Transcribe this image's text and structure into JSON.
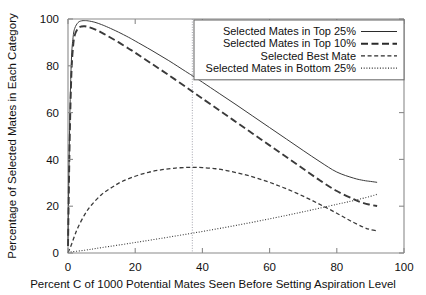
{
  "chart_data": {
    "type": "line",
    "title": "",
    "xlabel": "Percent C of 1000 Potential Mates Seen Before Setting Aspiration Level",
    "ylabel": "Percentage of Selected Mates in Each Category",
    "xlim": [
      0,
      100
    ],
    "ylim": [
      0,
      100
    ],
    "xticks": [
      0,
      20,
      40,
      60,
      80,
      100
    ],
    "yticks": [
      0,
      20,
      40,
      60,
      80,
      100
    ],
    "xtick_labels": [
      "0",
      "20",
      "40",
      "60",
      "80",
      "100"
    ],
    "ytick_labels": [
      "0",
      "20",
      "40",
      "60",
      "80",
      "100"
    ],
    "grid": false,
    "legend_position": "top-right",
    "annotations": [
      {
        "name": "optimal-stopping-reference-line",
        "type": "vline",
        "x": 37,
        "style": "dotted"
      }
    ],
    "series": [
      {
        "name": "Selected Mates in Top 25%",
        "style": "solid",
        "x": [
          0,
          0.5,
          1,
          1.5,
          2,
          3,
          4,
          5,
          6,
          8,
          10,
          12,
          15,
          18,
          20,
          25,
          30,
          35,
          37,
          40,
          45,
          50,
          55,
          60,
          65,
          70,
          75,
          80,
          85,
          88,
          90,
          92
        ],
        "values": [
          6,
          55,
          82,
          92,
          96,
          98.5,
          99.2,
          99.3,
          99.2,
          98.6,
          97.6,
          96.4,
          94.4,
          92.2,
          90.6,
          86.5,
          82.2,
          77.6,
          75.8,
          73,
          68.2,
          63.4,
          58.5,
          53.6,
          48.7,
          43.8,
          39,
          34.6,
          32,
          31,
          30.6,
          30.2
        ]
      },
      {
        "name": "Selected Mates in Top 10%",
        "style": "long-dash",
        "x": [
          0,
          0.5,
          1,
          1.5,
          2,
          3,
          4,
          5,
          6,
          8,
          10,
          12,
          15,
          18,
          20,
          25,
          30,
          35,
          37,
          40,
          45,
          50,
          55,
          60,
          65,
          70,
          75,
          80,
          85,
          88,
          90,
          92
        ],
        "values": [
          3,
          48,
          76,
          88,
          93,
          96,
          96.8,
          96.9,
          96.6,
          95.6,
          94.2,
          92.6,
          90.1,
          87.4,
          85.6,
          80.8,
          76,
          71,
          69,
          66,
          61,
          56,
          51,
          46,
          41,
          36,
          31,
          26.5,
          23,
          21.3,
          20.6,
          20.1
        ]
      },
      {
        "name": "Selected Best Mate",
        "style": "dash",
        "x": [
          0,
          1,
          2,
          3,
          5,
          7,
          10,
          13,
          16,
          20,
          24,
          28,
          32,
          36,
          37,
          40,
          44,
          48,
          52,
          56,
          60,
          64,
          68,
          72,
          76,
          80,
          84,
          88,
          90,
          92
        ],
        "values": [
          0.1,
          3.5,
          7.5,
          11,
          16.5,
          20.5,
          25,
          28,
          30.5,
          32.8,
          34.5,
          35.6,
          36.3,
          36.6,
          36.6,
          36.5,
          36,
          35,
          33.7,
          32.1,
          30.2,
          28,
          25.6,
          22.9,
          20,
          17,
          13.8,
          11,
          10,
          9.5
        ]
      },
      {
        "name": "Selected Mates in Bottom 25%",
        "style": "dotted",
        "x": [
          0,
          5,
          10,
          20,
          30,
          40,
          50,
          60,
          70,
          80,
          85,
          90,
          92
        ],
        "values": [
          0.3,
          1.2,
          2.3,
          4.5,
          6.8,
          9.2,
          11.8,
          14.6,
          17.6,
          20.8,
          22.4,
          24.2,
          25.1
        ]
      }
    ]
  },
  "legend": {
    "entries": [
      {
        "label": "Selected Mates in Top 25%",
        "style": "solid"
      },
      {
        "label": "Selected Mates in Top 10%",
        "style": "long-dash"
      },
      {
        "label": "Selected Best Mate",
        "style": "dash"
      },
      {
        "label": "Selected Mates in Bottom 25%",
        "style": "dotted"
      }
    ]
  },
  "colors": {
    "axis": "#8a8a8a",
    "text": "#111111",
    "line": "#3a3a3a",
    "reference_line": "#9a9aa5",
    "background": "#ffffff"
  }
}
